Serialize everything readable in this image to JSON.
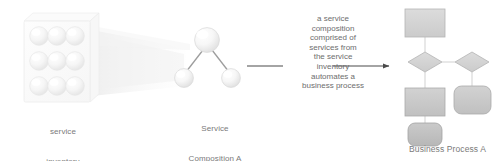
{
  "figure": {
    "type": "concept-diagram",
    "background": "#ffffff",
    "text_color": "#6e6e6e"
  },
  "service_inventory": {
    "label": "service\ninventory",
    "label_line1": "service",
    "label_line2": "inventory",
    "sphere_count": 9,
    "grid": {
      "rows": 3,
      "cols": 3
    },
    "box_fill": "#fcfcfc",
    "box_stroke": "#ededed",
    "sphere_fill": "#f2f2f2",
    "sphere_stroke": "#e4e4e4"
  },
  "service_composition": {
    "label": "Service\nComposition A",
    "label_line1": "Service",
    "label_line2": "Composition A",
    "node_count": 3,
    "nodes": [
      {
        "name": "parent-service",
        "cx": 207,
        "cy": 40,
        "r": 12.5
      },
      {
        "name": "child-service-left",
        "cx": 184,
        "cy": 78,
        "r": 9.5
      },
      {
        "name": "child-service-right",
        "cx": 231,
        "cy": 78,
        "r": 9.5
      }
    ],
    "link_color": "#9d9d9d",
    "sphere_fill": "#f4f4f4",
    "sphere_stroke": "#dedede"
  },
  "connection_beam": {
    "name": "inventory-to-composition-beam",
    "color": "#f4f4f4",
    "visible": true
  },
  "arrow": {
    "name": "automation-arrow",
    "direction": "right",
    "color": "#4a4a4a",
    "label_lines": [
      "a service",
      "composition",
      "comprised of",
      "services from",
      "the service",
      "inventory",
      "automates a",
      "business process"
    ]
  },
  "business_process": {
    "label": "Business Process A",
    "flow_stroke": "#cccccc",
    "shapes": [
      {
        "name": "start-task",
        "type": "rect",
        "x": 405,
        "y": 9,
        "w": 40,
        "h": 28,
        "fill": "#d0d0d0",
        "stroke": "#b0b0b0"
      },
      {
        "name": "decision-left",
        "type": "diamond",
        "cx": 425,
        "cy": 62,
        "w": 34,
        "h": 20,
        "fill": "#cfcfcf",
        "stroke": "#b3b3b3"
      },
      {
        "name": "decision-right",
        "type": "diamond",
        "cx": 472,
        "cy": 62,
        "w": 34,
        "h": 20,
        "fill": "#cfcfcf",
        "stroke": "#b3b3b3"
      },
      {
        "name": "task-left",
        "type": "rect",
        "x": 405,
        "y": 88,
        "w": 40,
        "h": 28,
        "fill": "#c7c7c7",
        "stroke": "#ababab"
      },
      {
        "name": "task-right",
        "type": "rounded",
        "x": 454,
        "y": 86,
        "w": 37,
        "h": 28,
        "fill": "#c4c4c4",
        "stroke": "#a8a8a8"
      },
      {
        "name": "end-task",
        "type": "rounded",
        "x": 408,
        "y": 123,
        "w": 34,
        "h": 23,
        "fill": "#bdbdbd",
        "stroke": "#a3a3a3"
      }
    ],
    "connectors": [
      {
        "from": "start-task",
        "to": "decision-left"
      },
      {
        "from": "decision-left",
        "to": "decision-right"
      },
      {
        "from": "decision-left",
        "to": "task-left"
      },
      {
        "from": "decision-right",
        "to": "task-right"
      },
      {
        "from": "task-left",
        "to": "end-task"
      }
    ]
  }
}
